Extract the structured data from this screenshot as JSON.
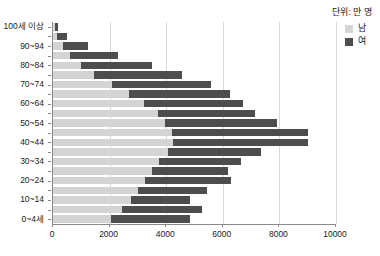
{
  "unit_caption": "단위: 만 명",
  "legend": {
    "items": [
      {
        "label": "남",
        "color": "#d4d4d4"
      },
      {
        "label": "여",
        "color": "#4d4d4d"
      }
    ]
  },
  "chart_data": {
    "type": "bar",
    "subtype": "stacked-horizontal",
    "orientation": "horizontal",
    "title": "",
    "xlabel": "",
    "ylabel": "",
    "unit": "단위: 만 명",
    "grid": true,
    "legend_position": "top-right",
    "xlim": [
      0,
      10000
    ],
    "xticks": [
      0,
      2000,
      4000,
      6000,
      8000,
      10000
    ],
    "xticklabels": [
      "0",
      "2000",
      "4000",
      "6000",
      "8000",
      "10000"
    ],
    "categories": [
      "100세 이상",
      "95~99",
      "90~94",
      "85~89",
      "80~84",
      "75~79",
      "70~74",
      "65~69",
      "60~64",
      "55~59",
      "50~54",
      "45~49",
      "40~44",
      "35~39",
      "30~34",
      "25~29",
      "20~24",
      "15~19",
      "10~14",
      "5~9",
      "0~4세"
    ],
    "ytick_labels_shown": [
      "100세 이상",
      "90~94",
      "80~84",
      "70~74",
      "60~64",
      "50~54",
      "40~44",
      "30~34",
      "20~24",
      "10~14",
      "0~4세"
    ],
    "series": [
      {
        "name": "남",
        "color": "#d4d4d4",
        "values": [
          60,
          140,
          340,
          600,
          1000,
          1450,
          2100,
          2700,
          3200,
          3700,
          3950,
          4200,
          4250,
          4050,
          3750,
          3500,
          3250,
          3000,
          2750,
          2450,
          2050
        ]
      },
      {
        "name": "여",
        "color": "#4d4d4d",
        "values": [
          120,
          350,
          900,
          1700,
          2500,
          3100,
          3500,
          3550,
          3500,
          3450,
          3950,
          4800,
          4750,
          3300,
          2900,
          2700,
          3050,
          2450,
          2100,
          2800,
          2800
        ]
      }
    ],
    "totals": [
      180,
      490,
      1240,
      2300,
      3500,
      4550,
      5600,
      6250,
      6700,
      7150,
      7900,
      9000,
      9000,
      7350,
      6650,
      6200,
      6300,
      5450,
      4850,
      5250,
      4850
    ]
  }
}
